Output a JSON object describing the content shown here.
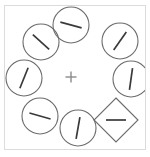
{
  "caption": {
    "text": ""
  },
  "frame": {
    "label": "stimulus display frame",
    "border_color": "#dcdcdc",
    "background_color": "#ffffff"
  },
  "display": {
    "title": "Visual search stimulus array",
    "fixation": {
      "symbol": "+",
      "label": "fixation cross",
      "x": 71,
      "y": 77,
      "size": 11,
      "color": "#8a8a8a"
    },
    "stroke_color": "#6b6b6b",
    "line_color": "#3a3a3a",
    "item_radius": 18,
    "item_count": 8,
    "target_count": 1,
    "distractor_count": 7
  },
  "chart_data": {
    "type": "scatter",
    "xlabel": "",
    "ylabel": "",
    "xlim": [
      0,
      150
    ],
    "ylim": [
      0,
      157
    ],
    "grid": false,
    "legend": "none",
    "annotations": [
      "+"
    ],
    "items": [
      {
        "index": 1,
        "name": "item-top",
        "shape": "circle",
        "role": "distractor",
        "cx": 71,
        "cy": 25,
        "r": 18,
        "line_angle_deg": 15,
        "line_length": 22,
        "orientation_label": "near-horizontal tilted clockwise"
      },
      {
        "index": 2,
        "name": "item-upper-left",
        "shape": "circle",
        "role": "distractor",
        "cx": 41,
        "cy": 42,
        "r": 18,
        "line_angle_deg": 42,
        "line_length": 22,
        "orientation_label": "diagonal down-right"
      },
      {
        "index": 3,
        "name": "item-upper-right",
        "shape": "circle",
        "role": "distractor",
        "cx": 120,
        "cy": 41,
        "r": 18,
        "line_angle_deg": -55,
        "line_length": 22,
        "orientation_label": "diagonal up-right"
      },
      {
        "index": 4,
        "name": "item-left",
        "shape": "circle",
        "role": "distractor",
        "cx": 24,
        "cy": 78,
        "r": 18,
        "line_angle_deg": -68,
        "line_length": 22,
        "orientation_label": "steep up-right"
      },
      {
        "index": 5,
        "name": "item-right",
        "shape": "circle",
        "role": "distractor",
        "cx": 131,
        "cy": 79,
        "r": 18,
        "line_angle_deg": -82,
        "line_length": 22,
        "orientation_label": "near-vertical"
      },
      {
        "index": 6,
        "name": "item-lower-left",
        "shape": "circle",
        "role": "distractor",
        "cx": 40,
        "cy": 116,
        "r": 18,
        "line_angle_deg": 16,
        "line_length": 22,
        "orientation_label": "near-horizontal tilted clockwise"
      },
      {
        "index": 7,
        "name": "item-bottom",
        "shape": "circle",
        "role": "distractor",
        "cx": 78,
        "cy": 128,
        "r": 18,
        "line_angle_deg": -80,
        "line_length": 22,
        "orientation_label": "near-vertical"
      },
      {
        "index": 8,
        "name": "item-target-diamond",
        "shape": "diamond",
        "role": "target",
        "cx": 116,
        "cy": 120,
        "r": 22,
        "line_angle_deg": 0,
        "line_length": 20,
        "orientation_label": "horizontal"
      }
    ]
  }
}
